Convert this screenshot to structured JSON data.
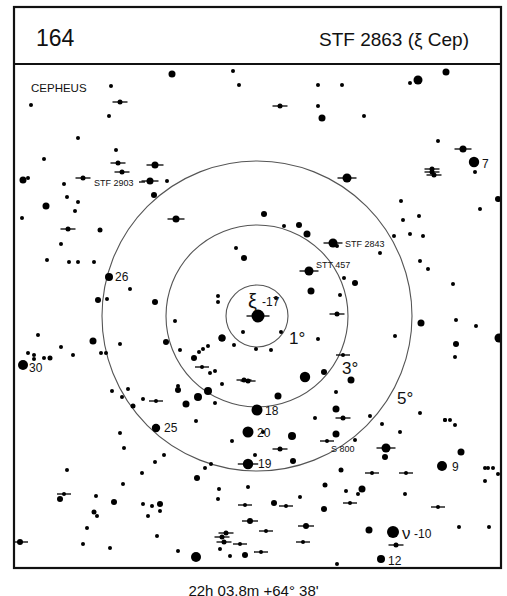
{
  "header": {
    "chart_number": "164",
    "object_title": "STF 2863 (ξ Cep)"
  },
  "constellation": "CEPHEUS",
  "center_coordinates": "22h 03.8m  +64° 38'",
  "colors": {
    "ink": "#000000",
    "ring": "#555555",
    "background": "#ffffff"
  },
  "chart_data": {
    "type": "star-finder-chart",
    "title": "STF 2863 (ξ Cep)",
    "chart_number": "164",
    "constellation": "CEPHEUS",
    "center": {
      "x": 257,
      "y": 316,
      "ra": "22h 03.8m",
      "dec": "+64° 38'"
    },
    "rings": [
      {
        "label": "1°",
        "r": 31,
        "label_x": 289,
        "label_y": 344
      },
      {
        "label": "3°",
        "r": 91,
        "label_x": 342,
        "label_y": 374
      },
      {
        "label": "5°",
        "r": 155,
        "label_x": 397,
        "label_y": 404
      }
    ],
    "star_labels": [
      {
        "text": "ξ",
        "x": 248,
        "y": 308,
        "size": 20,
        "sub": "-17",
        "sub_x": 262,
        "sub_y": 306
      },
      {
        "text": "STF 2903",
        "x": 94,
        "y": 186,
        "size": 9
      },
      {
        "text": "STF 2843",
        "x": 345,
        "y": 247,
        "size": 9
      },
      {
        "text": "STT 457",
        "x": 316,
        "y": 268,
        "size": 9
      },
      {
        "text": "26",
        "x": 115,
        "y": 281,
        "size": 12
      },
      {
        "text": "30",
        "x": 29,
        "y": 372,
        "size": 12
      },
      {
        "text": "18",
        "x": 265,
        "y": 415,
        "size": 12
      },
      {
        "text": "20",
        "x": 257,
        "y": 437,
        "size": 12
      },
      {
        "text": "19",
        "x": 258,
        "y": 468,
        "size": 12
      },
      {
        "text": "25",
        "x": 164,
        "y": 432,
        "size": 12
      },
      {
        "text": "S 800",
        "x": 331,
        "y": 452,
        "size": 9
      },
      {
        "text": "7",
        "x": 482,
        "y": 168,
        "size": 12
      },
      {
        "text": "9",
        "x": 452,
        "y": 471,
        "size": 12
      },
      {
        "text": "ν",
        "x": 402,
        "y": 539,
        "size": 17,
        "sub": "-10",
        "sub_x": 414,
        "sub_y": 538
      },
      {
        "text": "12",
        "x": 388,
        "y": 565,
        "size": 12
      }
    ],
    "stars": [
      [
        258,
        316,
        6.5,
        1
      ],
      [
        309,
        271,
        4.5,
        1
      ],
      [
        333,
        243,
        4.5,
        1
      ],
      [
        150,
        181,
        3.5,
        1
      ],
      [
        155,
        165,
        3.5,
        1
      ],
      [
        176,
        219,
        3.5,
        1
      ],
      [
        347,
        178,
        4.5,
        1
      ],
      [
        257,
        410,
        5.5,
        0
      ],
      [
        248,
        432,
        5.5,
        0
      ],
      [
        248,
        464,
        5.2,
        1
      ],
      [
        109,
        277,
        4,
        0
      ],
      [
        23,
        365,
        5,
        0
      ],
      [
        156,
        428,
        4.2,
        0
      ],
      [
        474,
        162,
        5.2,
        0
      ],
      [
        442,
        466,
        5,
        0
      ],
      [
        393,
        532,
        6,
        0
      ],
      [
        381,
        559,
        4,
        0
      ],
      [
        196,
        557,
        5,
        0
      ],
      [
        305,
        377,
        5.2,
        0
      ],
      [
        311,
        291,
        3.5,
        0
      ],
      [
        299,
        225,
        3,
        0
      ],
      [
        307,
        234,
        3.5,
        0
      ],
      [
        264,
        214,
        3,
        0
      ],
      [
        284,
        226,
        2,
        0
      ],
      [
        222,
        338,
        3.5,
        0
      ],
      [
        218,
        302,
        2,
        0
      ],
      [
        234,
        345,
        2,
        0
      ],
      [
        243,
        332,
        2,
        0
      ],
      [
        276,
        298,
        2,
        0
      ],
      [
        281,
        332,
        2,
        0
      ],
      [
        218,
        296,
        2,
        0
      ],
      [
        236,
        248,
        2,
        0
      ],
      [
        244,
        258,
        3,
        0
      ],
      [
        222,
        338,
        3.5,
        0
      ],
      [
        215,
        371,
        2,
        0
      ],
      [
        215,
        403,
        2,
        0
      ],
      [
        222,
        384,
        2,
        0
      ],
      [
        244,
        380,
        2.5,
        1
      ],
      [
        271,
        350,
        2,
        0
      ],
      [
        256,
        349,
        2,
        0
      ],
      [
        248,
        381,
        2.5,
        1
      ],
      [
        278,
        396,
        3.5,
        0
      ],
      [
        318,
        339,
        2,
        0
      ],
      [
        337,
        314,
        2.5,
        1
      ],
      [
        340,
        295,
        2,
        0
      ],
      [
        337,
        246,
        2,
        0
      ],
      [
        344,
        278,
        2,
        0
      ],
      [
        355,
        283,
        3,
        0
      ],
      [
        343,
        355,
        2,
        1
      ],
      [
        324,
        372,
        3,
        0
      ],
      [
        336,
        409,
        3.5,
        0
      ],
      [
        336,
        392,
        2,
        0
      ],
      [
        343,
        418,
        2.5,
        1
      ],
      [
        327,
        441,
        2,
        1
      ],
      [
        336,
        434,
        3.5,
        0
      ],
      [
        292,
        436,
        4,
        0
      ],
      [
        293,
        461,
        3,
        0
      ],
      [
        280,
        449,
        2.5,
        1
      ],
      [
        263,
        432,
        2,
        0
      ],
      [
        255,
        455,
        2,
        0
      ],
      [
        198,
        397,
        4,
        0
      ],
      [
        208,
        391,
        4,
        0
      ],
      [
        186,
        404,
        3.5,
        0
      ],
      [
        210,
        373,
        2,
        0
      ],
      [
        202,
        367,
        2,
        1
      ],
      [
        178,
        390,
        3,
        0
      ],
      [
        156,
        401,
        2,
        1
      ],
      [
        133,
        406,
        2.5,
        0
      ],
      [
        122,
        397,
        2,
        0
      ],
      [
        143,
        399,
        2,
        0
      ],
      [
        128,
        389,
        2,
        0
      ],
      [
        112,
        391,
        2,
        0
      ],
      [
        106,
        353,
        2,
        0
      ],
      [
        101,
        353,
        2,
        0
      ],
      [
        93,
        341,
        3.5,
        0
      ],
      [
        98,
        300,
        3,
        0
      ],
      [
        120,
        344,
        2,
        0
      ],
      [
        155,
        302,
        3,
        0
      ],
      [
        154,
        195,
        3,
        0
      ],
      [
        167,
        181,
        2,
        0
      ],
      [
        122,
        172,
        2.5,
        1
      ],
      [
        118,
        163,
        2.5,
        1
      ],
      [
        116,
        150,
        2,
        0
      ],
      [
        83,
        178,
        2.5,
        1
      ],
      [
        64,
        184,
        2,
        0
      ],
      [
        67,
        197,
        2,
        0
      ],
      [
        78,
        202,
        2,
        0
      ],
      [
        75,
        211,
        2,
        0
      ],
      [
        68,
        229,
        2.5,
        1
      ],
      [
        46,
        206,
        3.5,
        0
      ],
      [
        22,
        218,
        2,
        0
      ],
      [
        47,
        260,
        2,
        0
      ],
      [
        69,
        262,
        2,
        0
      ],
      [
        78,
        262,
        2,
        0
      ],
      [
        94,
        262,
        2,
        0
      ],
      [
        100,
        230,
        2.5,
        0
      ],
      [
        120,
        102,
        2.5,
        1
      ],
      [
        61,
        244,
        2,
        0
      ],
      [
        38,
        335,
        2,
        0
      ],
      [
        50,
        358,
        2.5,
        0
      ],
      [
        34,
        355,
        2,
        0
      ],
      [
        73,
        355,
        2,
        0
      ],
      [
        28,
        353,
        2,
        0
      ],
      [
        34,
        359,
        2,
        0
      ],
      [
        44,
        358,
        2,
        0
      ],
      [
        61,
        347,
        2,
        0
      ],
      [
        107,
        299,
        2,
        0
      ],
      [
        130,
        289,
        2,
        0
      ],
      [
        23,
        180,
        3.5,
        0
      ],
      [
        28,
        178,
        2,
        0
      ],
      [
        44,
        159,
        2,
        0
      ],
      [
        109,
        116,
        2,
        0
      ],
      [
        31,
        105,
        2,
        0
      ],
      [
        78,
        138,
        2,
        0
      ],
      [
        111,
        86,
        2,
        0
      ],
      [
        172,
        74,
        3.5,
        0
      ],
      [
        233,
        71,
        2,
        0
      ],
      [
        239,
        85,
        2,
        0
      ],
      [
        280,
        106,
        2.5,
        1
      ],
      [
        318,
        85,
        2,
        0
      ],
      [
        318,
        106,
        2,
        0
      ],
      [
        322,
        118,
        3.5,
        0
      ],
      [
        342,
        85,
        2,
        0
      ],
      [
        418,
        80,
        4.5,
        0
      ],
      [
        410,
        83,
        2,
        0
      ],
      [
        446,
        72,
        3.5,
        0
      ],
      [
        364,
        116,
        2,
        0
      ],
      [
        438,
        141,
        2,
        0
      ],
      [
        463,
        149,
        3.5,
        1
      ],
      [
        475,
        172,
        2,
        0
      ],
      [
        432,
        172,
        2.5,
        1
      ],
      [
        434,
        175,
        2.5,
        1
      ],
      [
        432,
        169,
        2.5,
        1
      ],
      [
        401,
        201,
        2,
        0
      ],
      [
        403,
        220,
        2,
        0
      ],
      [
        423,
        236,
        2,
        0
      ],
      [
        410,
        234,
        2,
        0
      ],
      [
        380,
        253,
        2,
        0
      ],
      [
        420,
        261,
        2,
        0
      ],
      [
        428,
        269,
        2,
        0
      ],
      [
        394,
        236,
        2,
        0
      ],
      [
        419,
        216,
        2,
        0
      ],
      [
        480,
        209,
        2,
        0
      ],
      [
        498,
        199,
        3,
        0
      ],
      [
        421,
        323,
        3.5,
        0
      ],
      [
        395,
        336,
        2,
        0
      ],
      [
        456,
        344,
        3,
        0
      ],
      [
        456,
        320,
        2,
        0
      ],
      [
        476,
        326,
        2,
        0
      ],
      [
        499,
        338,
        4.5,
        0
      ],
      [
        455,
        357,
        2,
        0
      ],
      [
        453,
        284,
        2,
        0
      ],
      [
        351,
        380,
        3.5,
        0
      ],
      [
        450,
        420,
        2,
        0
      ],
      [
        455,
        425,
        2,
        0
      ],
      [
        445,
        420,
        2,
        0
      ],
      [
        461,
        452,
        3.5,
        0
      ],
      [
        485,
        468,
        2,
        0
      ],
      [
        488,
        468,
        2,
        0
      ],
      [
        485,
        481,
        2,
        0
      ],
      [
        386,
        448,
        4.5,
        1
      ],
      [
        385,
        457,
        3,
        0
      ],
      [
        372,
        473,
        2,
        1
      ],
      [
        406,
        473,
        2,
        1
      ],
      [
        493,
        468,
        2,
        0
      ],
      [
        498,
        474,
        2,
        0
      ],
      [
        405,
        494,
        2,
        0
      ],
      [
        438,
        507,
        2,
        1
      ],
      [
        369,
        530,
        3.5,
        0
      ],
      [
        396,
        545,
        2.5,
        1
      ],
      [
        459,
        527,
        2,
        0
      ],
      [
        489,
        527,
        2,
        0
      ],
      [
        20,
        542,
        3,
        1
      ],
      [
        110,
        548,
        2,
        0
      ],
      [
        157,
        536,
        2,
        0
      ],
      [
        178,
        551,
        2,
        0
      ],
      [
        230,
        556,
        2,
        0
      ],
      [
        245,
        555,
        3,
        0
      ],
      [
        337,
        564,
        2,
        0
      ],
      [
        220,
        549,
        2,
        0
      ],
      [
        222,
        537,
        2.5,
        1
      ],
      [
        224,
        542,
        2.5,
        1
      ],
      [
        226,
        533,
        2.5,
        1
      ],
      [
        266,
        531,
        2,
        1
      ],
      [
        250,
        521,
        3,
        1
      ],
      [
        306,
        526,
        3,
        1
      ],
      [
        240,
        544,
        2,
        1
      ],
      [
        303,
        542,
        2,
        1
      ],
      [
        261,
        552,
        2,
        1
      ],
      [
        286,
        506,
        2,
        1
      ],
      [
        325,
        485,
        2.5,
        0
      ],
      [
        362,
        489,
        3.5,
        0
      ],
      [
        274,
        503,
        3,
        0
      ],
      [
        346,
        491,
        2,
        0
      ],
      [
        358,
        494,
        2,
        0
      ],
      [
        350,
        503,
        2,
        1
      ],
      [
        219,
        489,
        2,
        0
      ],
      [
        245,
        505,
        2,
        1
      ],
      [
        226,
        580,
        2,
        0
      ],
      [
        211,
        464,
        2,
        0
      ],
      [
        160,
        504,
        3,
        0
      ],
      [
        143,
        504,
        2,
        0
      ],
      [
        114,
        502,
        3,
        0
      ],
      [
        96,
        496,
        2,
        0
      ],
      [
        120,
        433,
        2,
        0
      ],
      [
        60,
        499,
        3,
        0
      ],
      [
        64,
        494,
        2,
        1
      ],
      [
        94,
        512,
        2.5,
        0
      ],
      [
        87,
        528,
        2,
        0
      ],
      [
        83,
        544,
        2,
        0
      ],
      [
        160,
        511,
        2,
        0
      ],
      [
        148,
        516,
        2,
        0
      ],
      [
        152,
        506,
        2,
        0
      ],
      [
        123,
        484,
        2,
        0
      ],
      [
        67,
        470,
        2,
        0
      ],
      [
        97,
        516,
        2,
        0
      ],
      [
        197,
        478,
        3,
        0
      ],
      [
        248,
        487,
        2,
        0
      ],
      [
        324,
        509,
        3,
        0
      ],
      [
        355,
        440,
        2,
        0
      ],
      [
        315,
        418,
        2,
        0
      ],
      [
        370,
        416,
        2,
        0
      ],
      [
        420,
        413,
        2,
        0
      ],
      [
        445,
        420,
        2,
        0
      ],
      [
        400,
        432,
        2,
        0
      ],
      [
        382,
        424,
        2,
        0
      ],
      [
        164,
        455,
        2,
        0
      ],
      [
        124,
        448,
        2,
        0
      ],
      [
        155,
        462,
        2,
        0
      ],
      [
        142,
        473,
        2,
        0
      ],
      [
        205,
        468,
        2,
        0
      ],
      [
        218,
        499,
        2,
        0
      ],
      [
        300,
        497,
        2,
        0
      ],
      [
        180,
        350,
        2,
        0
      ],
      [
        166,
        342,
        3,
        0
      ],
      [
        175,
        321,
        2,
        0
      ],
      [
        199,
        352,
        2,
        0
      ],
      [
        194,
        358,
        3,
        0
      ],
      [
        203,
        349,
        2,
        0
      ],
      [
        208,
        346,
        2,
        0
      ],
      [
        178,
        386,
        2,
        0
      ],
      [
        196,
        421,
        2,
        0
      ],
      [
        232,
        441,
        2,
        0
      ],
      [
        341,
        470,
        2.5,
        0
      ]
    ]
  }
}
